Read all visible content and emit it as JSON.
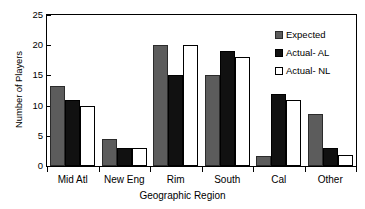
{
  "chart_data": {
    "type": "bar",
    "title": "",
    "xlabel": "Geographic Region",
    "ylabel": "Number of Players",
    "ylim": [
      0,
      25
    ],
    "yticks": [
      0,
      5,
      10,
      15,
      20,
      25
    ],
    "grid": false,
    "legend_position": "top-right",
    "categories": [
      "Mid Atl",
      "New Eng",
      "Rim",
      "South",
      "Cal",
      "Other"
    ],
    "series": [
      {
        "name": "Expected",
        "color": "#5c5c5c",
        "values": [
          13.2,
          4.5,
          20.0,
          15.1,
          1.6,
          8.6
        ]
      },
      {
        "name": "Actual- AL",
        "color": "#111111",
        "values": [
          11.0,
          3.0,
          15.0,
          19.0,
          12.0,
          2.9
        ]
      },
      {
        "name": "Actual- NL",
        "color": "#ffffff",
        "values": [
          10.0,
          3.0,
          20.0,
          18.0,
          11.0,
          1.8
        ]
      }
    ]
  }
}
